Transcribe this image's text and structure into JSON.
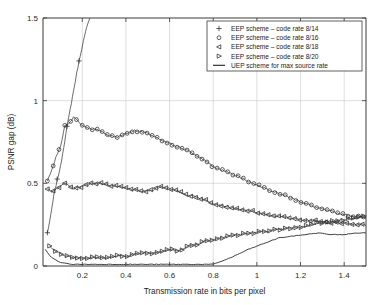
{
  "chart_data": {
    "type": "line",
    "title": "",
    "xlabel": "Transmission rate in bits per pixel",
    "ylabel": "PSNR gap (dB)",
    "xlim": [
      0.02,
      1.5
    ],
    "ylim": [
      0,
      1.5
    ],
    "xticks": [
      0.2,
      0.4,
      0.6,
      0.8,
      1,
      1.2,
      1.4
    ],
    "xtick_labels": [
      "0.2",
      "0.4",
      "0.6",
      "0.8",
      "1",
      "1.2",
      "1.4"
    ],
    "yticks": [
      0,
      0.5,
      1,
      1.5
    ],
    "ytick_labels": [
      "0",
      "0.5",
      "1",
      "1.5"
    ],
    "grid": true,
    "legend_position": "upper right",
    "series": [
      {
        "name": "EEP scheme – code rate 8/14",
        "marker": "plus",
        "x": [
          0.04,
          0.055,
          0.07,
          0.085,
          0.1,
          0.115,
          0.13,
          0.145,
          0.16,
          0.175,
          0.19,
          0.205,
          0.22,
          0.235
        ],
        "y": [
          0.2,
          0.3,
          0.43,
          0.52,
          0.6,
          0.72,
          0.84,
          0.95,
          1.06,
          1.17,
          1.27,
          1.36,
          1.44,
          1.5
        ]
      },
      {
        "name": "EEP scheme – code rate 8/16",
        "marker": "circle",
        "x": [
          0.04,
          0.06,
          0.08,
          0.1,
          0.12,
          0.14,
          0.16,
          0.18,
          0.2,
          0.24,
          0.28,
          0.32,
          0.36,
          0.4,
          0.44,
          0.48,
          0.52,
          0.56,
          0.6,
          0.64,
          0.68,
          0.72,
          0.76,
          0.8,
          0.86,
          0.92,
          0.98,
          1.04,
          1.1,
          1.16,
          1.22,
          1.28,
          1.34,
          1.4,
          1.46,
          1.5
        ],
        "y": [
          0.52,
          0.58,
          0.66,
          0.72,
          0.85,
          0.86,
          0.9,
          0.88,
          0.85,
          0.83,
          0.82,
          0.79,
          0.78,
          0.8,
          0.82,
          0.81,
          0.79,
          0.76,
          0.74,
          0.72,
          0.7,
          0.67,
          0.64,
          0.6,
          0.57,
          0.54,
          0.5,
          0.47,
          0.44,
          0.41,
          0.38,
          0.35,
          0.33,
          0.31,
          0.3,
          0.29
        ]
      },
      {
        "name": "EEP scheme – code rate 8/18",
        "marker": "triangle-left",
        "x": [
          0.04,
          0.06,
          0.08,
          0.1,
          0.12,
          0.14,
          0.16,
          0.2,
          0.24,
          0.28,
          0.32,
          0.36,
          0.4,
          0.44,
          0.48,
          0.52,
          0.56,
          0.6,
          0.64,
          0.68,
          0.72,
          0.76,
          0.8,
          0.86,
          0.92,
          0.98,
          1.04,
          1.1,
          1.16,
          1.22,
          1.28,
          1.34,
          1.4,
          1.46,
          1.5
        ],
        "y": [
          0.47,
          0.45,
          0.47,
          0.48,
          0.5,
          0.48,
          0.47,
          0.48,
          0.5,
          0.5,
          0.49,
          0.48,
          0.47,
          0.46,
          0.45,
          0.46,
          0.48,
          0.47,
          0.45,
          0.43,
          0.42,
          0.4,
          0.38,
          0.36,
          0.34,
          0.33,
          0.31,
          0.3,
          0.29,
          0.28,
          0.27,
          0.26,
          0.26,
          0.25,
          0.25
        ]
      },
      {
        "name": "EEP scheme – code rate 8/20",
        "marker": "triangle-right",
        "x": [
          0.05,
          0.07,
          0.09,
          0.11,
          0.13,
          0.16,
          0.2,
          0.24,
          0.28,
          0.32,
          0.36,
          0.4,
          0.44,
          0.48,
          0.52,
          0.56,
          0.6,
          0.64,
          0.68,
          0.72,
          0.76,
          0.8,
          0.86,
          0.92,
          0.98,
          1.04,
          1.1,
          1.16,
          1.22,
          1.28,
          1.34,
          1.4,
          1.46,
          1.5
        ],
        "y": [
          0.12,
          0.1,
          0.08,
          0.07,
          0.06,
          0.05,
          0.05,
          0.05,
          0.05,
          0.05,
          0.06,
          0.06,
          0.07,
          0.08,
          0.08,
          0.09,
          0.1,
          0.09,
          0.12,
          0.13,
          0.15,
          0.16,
          0.18,
          0.19,
          0.2,
          0.21,
          0.22,
          0.23,
          0.24,
          0.26,
          0.27,
          0.28,
          0.29,
          0.3
        ]
      },
      {
        "name": "UEP scheme for max source rate",
        "marker": "none",
        "x": [
          0.03,
          0.06,
          0.1,
          0.16,
          0.24,
          0.32,
          0.4,
          0.48,
          0.56,
          0.64,
          0.72,
          0.8,
          0.88,
          0.96,
          1.04,
          1.1,
          1.16,
          1.22,
          1.28,
          1.34,
          1.4,
          1.46,
          1.5
        ],
        "y": [
          0.1,
          0.05,
          0.02,
          0.01,
          0.01,
          0.01,
          0.01,
          0.01,
          0.01,
          0.01,
          0.01,
          0.01,
          0.05,
          0.1,
          0.14,
          0.17,
          0.18,
          0.19,
          0.2,
          0.19,
          0.19,
          0.2,
          0.2
        ]
      }
    ]
  },
  "legend": {
    "entries": [
      {
        "marker_symbol": "+",
        "label": "EEP scheme – code rate 8/14"
      },
      {
        "marker_symbol": "O",
        "label": "EEP scheme – code rate 8/16"
      },
      {
        "marker_symbol": "◁",
        "label": "EEP scheme – code rate 8/18"
      },
      {
        "marker_symbol": "▷",
        "label": "EEP scheme – code rate 8/20"
      },
      {
        "marker_symbol": "—",
        "label": "UEP scheme for max source rate"
      }
    ]
  },
  "colors": {
    "series": "#2c2c2c",
    "axis": "#3a3a3a",
    "grid": "#c8c8c8",
    "background": "#ffffff"
  }
}
